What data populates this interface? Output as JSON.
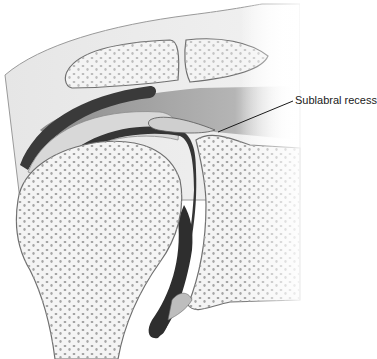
{
  "figure": {
    "style": "grayscale anatomical illustration",
    "labels": [
      {
        "text": "Sublabral recess",
        "x": 295,
        "y": 98,
        "pointer_to": [
          218,
          132
        ]
      }
    ]
  },
  "colors": {
    "background": "#ffffff",
    "bone_fill": "#f4f4f4",
    "bone_outline": "#7a7a7a",
    "trabecular_dots": "#9a9a9a",
    "joint_space": "#3a3a3a",
    "cartilage": "#d8d8d8",
    "muscle": "#a8a8a8",
    "leader_line": "#1a1a1a"
  }
}
